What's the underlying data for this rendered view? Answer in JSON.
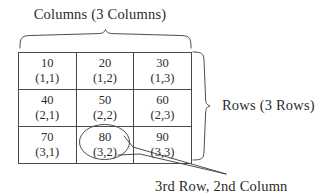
{
  "figure": {
    "columns_label": "Columns (3 Columns)",
    "rows_label": "Rows (3 Rows)",
    "pointer_caption": "3rd Row, 2nd Column",
    "ink_color": "#3a3a3a",
    "background_color": "#ffffff"
  },
  "table": {
    "row_count": 3,
    "column_count": 3,
    "highlighted_cell": "(3,2)",
    "rows": [
      [
        {
          "value": "10",
          "index": "(1,1)"
        },
        {
          "value": "20",
          "index": "(1,2)"
        },
        {
          "value": "30",
          "index": "(1,3)"
        }
      ],
      [
        {
          "value": "40",
          "index": "(2,1)"
        },
        {
          "value": "50",
          "index": "(2,2)"
        },
        {
          "value": "60",
          "index": "(2,3)"
        }
      ],
      [
        {
          "value": "70",
          "index": "(3,1)"
        },
        {
          "value": "80",
          "index": "(3,2)"
        },
        {
          "value": "90",
          "index": "(3,3)"
        }
      ]
    ]
  }
}
